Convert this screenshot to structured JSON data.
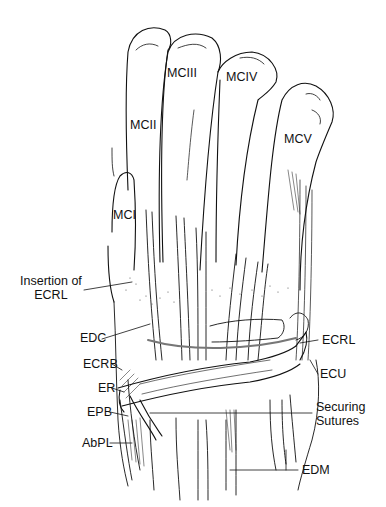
{
  "figure": {
    "type": "anatomical-illustration",
    "bone_labels": [
      {
        "id": "mci",
        "text": "MCI",
        "x": 113,
        "y": 214
      },
      {
        "id": "mcii",
        "text": "MCII",
        "x": 130,
        "y": 124
      },
      {
        "id": "mciii",
        "text": "MCIII",
        "x": 167,
        "y": 71
      },
      {
        "id": "mciv",
        "text": "MCIV",
        "x": 226,
        "y": 75
      },
      {
        "id": "mcv",
        "text": "MCV",
        "x": 284,
        "y": 138
      }
    ],
    "left_labels": [
      {
        "id": "insertion-ecrl",
        "line1": "Insertion of",
        "line2": "ECRL",
        "x": 22,
        "y": 279
      },
      {
        "id": "edc",
        "text": "EDC",
        "x": 80,
        "y": 336
      },
      {
        "id": "ecrb",
        "text": "ECRB",
        "x": 83,
        "y": 362
      },
      {
        "id": "er",
        "text": "ER",
        "x": 98,
        "y": 385
      },
      {
        "id": "epb",
        "text": "EPB",
        "x": 87,
        "y": 410
      },
      {
        "id": "abpl",
        "text": "AbPL",
        "x": 82,
        "y": 440
      }
    ],
    "right_labels": [
      {
        "id": "ecrl",
        "text": "ECRL",
        "x": 322,
        "y": 336
      },
      {
        "id": "ecu",
        "text": "ECU",
        "x": 320,
        "y": 371
      },
      {
        "id": "securing-sutures",
        "line1": "Securing",
        "line2": "Sutures",
        "x": 316,
        "y": 400
      },
      {
        "id": "edm",
        "text": "EDM",
        "x": 302,
        "y": 464
      }
    ],
    "colors": {
      "line": "#111111",
      "background": "#ffffff",
      "stipple": "#555555"
    }
  }
}
